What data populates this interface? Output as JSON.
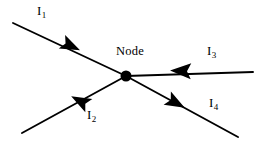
{
  "diagram": {
    "background_color": "#ffffff",
    "stroke_color": "#000000",
    "node": {
      "label": "Node",
      "center_x": 126,
      "center_y": 76,
      "radius": 5.5
    },
    "branches": [
      {
        "id": "I1",
        "label_main": "I",
        "label_sub": "1",
        "label_x": 37,
        "label_y": 4,
        "direction": "into-node",
        "from_x": 13,
        "from_y": 23,
        "to_x": 126,
        "to_y": 76,
        "arrow_x": 71,
        "arrow_y": 46,
        "arrow_angle_deg": 25
      },
      {
        "id": "I2",
        "label_main": "I",
        "label_sub": "2",
        "label_x": 87,
        "label_y": 108,
        "direction": "out-of-node",
        "from_x": 126,
        "from_y": 76,
        "to_x": 22,
        "to_y": 133,
        "arrow_x": 80,
        "arrow_y": 101,
        "arrow_angle_deg": 208
      },
      {
        "id": "I3",
        "label_main": "I",
        "label_sub": "3",
        "label_x": 207,
        "label_y": 44,
        "direction": "into-node",
        "from_x": 253,
        "from_y": 72,
        "to_x": 126,
        "to_y": 76,
        "arrow_x": 181,
        "arrow_y": 71,
        "arrow_angle_deg": 182
      },
      {
        "id": "I4",
        "label_main": "I",
        "label_sub": "4",
        "label_x": 209,
        "label_y": 96,
        "direction": "out-of-node",
        "from_x": 126,
        "from_y": 76,
        "to_x": 238,
        "to_y": 137,
        "arrow_x": 176,
        "arrow_y": 103,
        "arrow_angle_deg": 29
      }
    ]
  }
}
